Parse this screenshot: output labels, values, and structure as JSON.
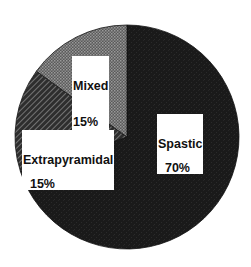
{
  "chart_data": {
    "type": "pie",
    "title": "",
    "start_angle_deg": 0,
    "direction": "clockwise",
    "slices": [
      {
        "name": "Spastic",
        "value": 70,
        "label": "Spastic",
        "pct_label": "70%",
        "fill": "#1c1c1c",
        "pattern": "solid"
      },
      {
        "name": "Extrapyramidal",
        "value": 15,
        "label": "Extrapyramidal",
        "pct_label": "15%",
        "fill": "#3a3a3a",
        "pattern": "diagonal-hatch"
      },
      {
        "name": "Mixed",
        "value": 15,
        "label": "Mixed",
        "pct_label": "15%",
        "fill": "#6e6e6e",
        "pattern": "dotted-halftone"
      }
    ],
    "legend": "none",
    "grid": false
  },
  "labels": {
    "spastic": {
      "name": "Spastic",
      "pct": "70%"
    },
    "extrapyramidal": {
      "name": "Extrapyramidal",
      "pct": "15%"
    },
    "mixed": {
      "name": "Mixed",
      "pct": "15%"
    }
  }
}
